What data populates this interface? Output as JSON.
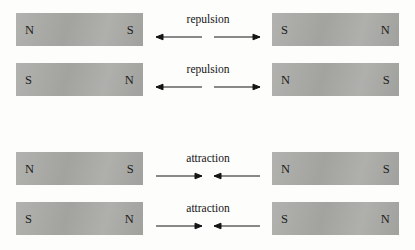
{
  "figure": {
    "background_color": "#fdfdfc",
    "magnet_color": "#a9a9a6",
    "ink_color": "#141414",
    "pole_north": "N",
    "pole_south": "S",
    "labels": {
      "repulsion": "repulsion",
      "attraction": "attraction"
    },
    "arrow_icons": {
      "repulsion": "arrows-diverging-icon",
      "attraction": "arrows-converging-icon"
    }
  },
  "rows": [
    {
      "id": "row-1",
      "top": 13,
      "interaction": "repulsion",
      "arrow_direction": "outward",
      "left_magnet": {
        "left_pole": "N",
        "right_pole": "S"
      },
      "right_magnet": {
        "left_pole": "S",
        "right_pole": "N"
      }
    },
    {
      "id": "row-2",
      "top": 63,
      "interaction": "repulsion",
      "arrow_direction": "outward",
      "left_magnet": {
        "left_pole": "S",
        "right_pole": "N"
      },
      "right_magnet": {
        "left_pole": "N",
        "right_pole": "S"
      }
    },
    {
      "id": "row-3",
      "top": 152,
      "interaction": "attraction",
      "arrow_direction": "inward",
      "left_magnet": {
        "left_pole": "N",
        "right_pole": "S"
      },
      "right_magnet": {
        "left_pole": "N",
        "right_pole": "S"
      }
    },
    {
      "id": "row-4",
      "top": 202,
      "interaction": "attraction",
      "arrow_direction": "inward",
      "left_magnet": {
        "left_pole": "S",
        "right_pole": "N"
      },
      "right_magnet": {
        "left_pole": "S",
        "right_pole": "N"
      }
    }
  ]
}
